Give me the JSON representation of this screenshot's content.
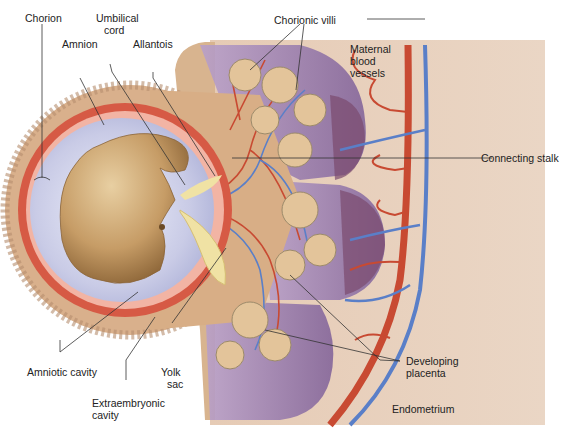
{
  "diagram": {
    "colors": {
      "chorion_tissue": "#d9b08c",
      "amnion_red": "#d65a45",
      "amniotic_fluid": "#c9cbe6",
      "embryo": "#c9a06a",
      "yolk_sac": "#f0e2a4",
      "villi_purple": "#a78bbd",
      "endometrium": "#e6cbb5",
      "artery": "#c84a32",
      "vein": "#5a7fc8"
    },
    "labels": {
      "chorion": "Chorion",
      "umbilical_cord_1": "Umbilical",
      "umbilical_cord_2": "cord",
      "amnion": "Amnion",
      "allantois": "Allantois",
      "chorionic_villi": "Chorionic villi",
      "maternal_1": "Maternal",
      "maternal_2": "blood",
      "maternal_3": "vessels",
      "connecting_stalk": "Connecting stalk",
      "amniotic_cavity": "Amniotic cavity",
      "yolk_1": "Yolk",
      "yolk_2": "sac",
      "extra_1": "Extraembryonic",
      "extra_2": "cavity",
      "placenta_1": "Developing",
      "placenta_2": "placenta",
      "endometrium": "Endometrium"
    }
  }
}
